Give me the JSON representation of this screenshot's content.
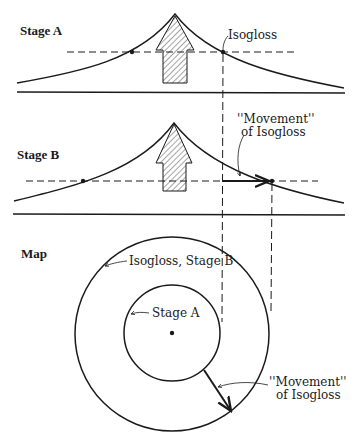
{
  "labels": {
    "stage_a": "Stage A",
    "stage_b": "Stage B",
    "map": "Map",
    "isogloss": "Isogloss",
    "movement_b_line1": "''Movement''",
    "movement_b_line2": "of Isogloss",
    "isogloss_stage_b": "Isogloss, Stage B",
    "map_stage_a": "Stage A",
    "movement_map_line1": "''Movement''",
    "movement_map_line2": "of Isogloss"
  },
  "colors": {
    "ink": "#1a1a1a",
    "background": "#ffffff"
  }
}
